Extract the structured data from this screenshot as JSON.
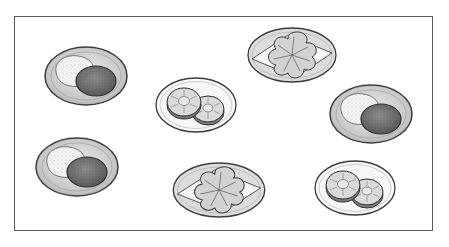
{
  "scene": {
    "title": "",
    "frame": {
      "x": 14,
      "y": 16,
      "w": 419,
      "h": 215,
      "stroke": "#5a5a5a"
    },
    "colors": {
      "outline": "#3d3d3d",
      "plate_dark": "#c8c8c8",
      "plate_light": "#f4f4f4",
      "rice": "#f2f2f2",
      "patty": "#7a7a7a",
      "pineapple": "#d9d9d9",
      "flower": "#d6d6d6"
    },
    "plates": [
      {
        "kind": "rice-and-patty",
        "cx": 86,
        "cy": 76,
        "label": "rice-and-patty-plate-1"
      },
      {
        "kind": "pineapple",
        "cx": 196,
        "cy": 105,
        "label": "pineapple-plate-1"
      },
      {
        "kind": "flower-cake",
        "cx": 292,
        "cy": 55,
        "label": "flower-cake-plate-1"
      },
      {
        "kind": "rice-and-patty",
        "cx": 371,
        "cy": 114,
        "label": "rice-and-patty-plate-2"
      },
      {
        "kind": "rice-and-patty",
        "cx": 77,
        "cy": 167,
        "label": "rice-and-patty-plate-3"
      },
      {
        "kind": "flower-cake",
        "cx": 219,
        "cy": 190,
        "label": "flower-cake-plate-2"
      },
      {
        "kind": "pineapple",
        "cx": 355,
        "cy": 188,
        "label": "pineapple-plate-2"
      }
    ]
  }
}
